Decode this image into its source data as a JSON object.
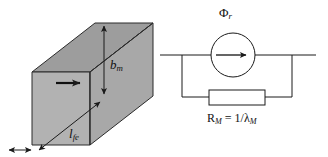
{
  "figure": {
    "background_color": "#ffffff",
    "line_color": "#1a1a1a",
    "magnet_fill_front": "#a8a8a8",
    "magnet_fill_top": "#9a9a9a",
    "magnet_fill_side": "#b4b4b4"
  },
  "magnet_block": {
    "name": "magnet-block",
    "magnetization_arrow": "right-arrow-icon",
    "labels": {
      "height": {
        "symbol": "b",
        "subscript": "m",
        "text": "bm"
      },
      "length": {
        "symbol": "l",
        "subscript": "fe",
        "text": "lfe"
      }
    },
    "dimension_lines": [
      {
        "name": "height-dimension",
        "orientation": "vertical",
        "label": "bm"
      },
      {
        "name": "length-dimension",
        "orientation": "diagonal",
        "label": "lfe"
      },
      {
        "name": "depth-dimension",
        "orientation": "horizontal",
        "label": ""
      }
    ]
  },
  "circuit": {
    "name": "equivalent-magnetic-circuit",
    "source": {
      "name": "flux-source",
      "type": "circle-source",
      "arrow": "right-arrow-icon",
      "label": {
        "symbol": "Φ",
        "subscript": "r",
        "text": "Φr"
      }
    },
    "reluctance": {
      "name": "reluctance-element",
      "type": "rectangle-resistor",
      "label": {
        "text": "RM = 1/λM",
        "symbol": "R",
        "subscript": "M",
        "expression": "1/λM"
      }
    },
    "label_parts": {
      "r_symbol": "R",
      "r_sub": "M",
      "equals": " = 1/",
      "lambda_symbol": "λ",
      "lambda_sub": "M"
    }
  }
}
